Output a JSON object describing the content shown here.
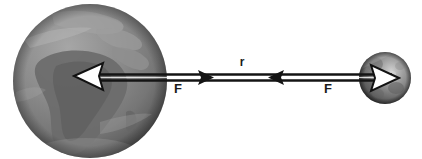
{
  "diagram": {
    "background_color": "#ffffff",
    "bodies": [
      {
        "id": "earth",
        "name": "Earth",
        "shape": "sphere",
        "cx": 90,
        "cy": 81,
        "r": 77,
        "base_color": "#8a8a8a",
        "highlight_color": "#a9a9a9",
        "shadow_color": "#4e4e4e",
        "landmass_color": "#6f6f6f",
        "ocean_color": "#949494"
      },
      {
        "id": "moon",
        "name": "Moon",
        "shape": "sphere",
        "cx": 385,
        "cy": 78,
        "r": 26,
        "base_color": "#7d7d7d",
        "highlight_color": "#d2d2d2",
        "shadow_color": "#3a3a3a",
        "crater_color": "#636363"
      }
    ],
    "labels": {
      "force_left": "F",
      "force_right": "F",
      "separation": "r"
    },
    "label_positions": {
      "force_left": {
        "x": 178,
        "y": 93
      },
      "force_right": {
        "x": 328,
        "y": 93
      },
      "separation": {
        "x": 242,
        "y": 66
      }
    },
    "vectors": [
      {
        "id": "force-on-earth",
        "label": "F",
        "direction": "left",
        "from_x": 385,
        "to_x": 76,
        "y": 77,
        "head_style": "hollow-white-outline",
        "line_color": "#141414"
      },
      {
        "id": "force-on-moon",
        "label": "F",
        "direction": "right",
        "from_x": 90,
        "to_x": 396,
        "y": 77,
        "head_style": "hollow-white-outline",
        "line_color": "#141414"
      },
      {
        "id": "separation-distance",
        "label": "r",
        "direction": "double",
        "from_x": 196,
        "to_x": 286,
        "y": 77,
        "head_style": "solid-small",
        "line_color": "#141414"
      }
    ]
  }
}
